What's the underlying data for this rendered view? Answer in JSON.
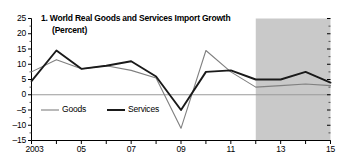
{
  "panel": {
    "title_line1": "1. World Real Goods and Services Import Growth",
    "title_line2": "(Percent)"
  },
  "legend": {
    "position": "inside-lower-left",
    "items": [
      {
        "label": "Goods",
        "color": "#808080",
        "width": 1.1
      },
      {
        "label": "Services",
        "color": "#1a1a1a",
        "width": 2.0
      }
    ]
  },
  "axes": {
    "y_ticks": [
      "25",
      "20",
      "15",
      "10",
      "5",
      "0",
      "-5",
      "-10",
      "-15"
    ],
    "x_ticks": [
      "2003",
      "05",
      "07",
      "09",
      "11",
      "13",
      "15"
    ]
  },
  "shading": {
    "label": "forecast-region",
    "color": "#c9c9c9",
    "from_year": 2012,
    "to_year": 2015
  },
  "chart_data": {
    "type": "line",
    "title": "1. World Real Goods and Services Import Growth (Percent)",
    "xlabel": "",
    "ylabel": "Percent",
    "ylim": [
      -15,
      25
    ],
    "xlim": [
      2003,
      2015
    ],
    "ytick_step": 5,
    "grid": false,
    "zero_line": true,
    "legend_position": "inside-lower-left",
    "x": [
      2003,
      2004,
      2005,
      2006,
      2007,
      2008,
      2009,
      2010,
      2011,
      2012,
      2013,
      2014,
      2015
    ],
    "xtick_labels": [
      "2003",
      "",
      "05",
      "",
      "07",
      "",
      "09",
      "",
      "11",
      "",
      "13",
      "",
      "15"
    ],
    "series": [
      {
        "name": "Goods",
        "color": "#808080",
        "values": [
          7.5,
          11.5,
          8.5,
          9.5,
          8.0,
          5.5,
          -11.0,
          14.5,
          7.5,
          2.5,
          3.0,
          3.5,
          3.0
        ]
      },
      {
        "name": "Services",
        "color": "#1a1a1a",
        "values": [
          4.5,
          14.5,
          8.5,
          9.5,
          11.0,
          6.0,
          -5.0,
          7.5,
          8.0,
          5.0,
          5.0,
          7.5,
          4.0
        ]
      }
    ],
    "annotations": [
      {
        "type": "shaded-band",
        "label": "projection",
        "x_from": 2012,
        "x_to": 2015
      }
    ]
  }
}
